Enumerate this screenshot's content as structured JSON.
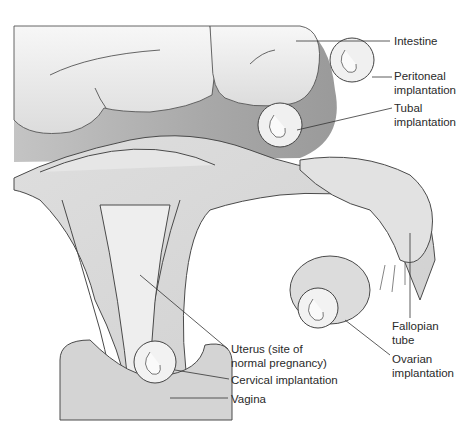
{
  "figure": {
    "colors": {
      "background": "#ffffff",
      "intestine_fill": "#ececec",
      "peritoneum_fill": "#a9a9a9",
      "tissue_fill": "#d8d8d8",
      "outline": "#4a4a4a",
      "leader_line": "#333333",
      "text": "#2a2a2a"
    }
  },
  "labels": {
    "intestine": "Intestine",
    "peritoneal_1": "Peritoneal",
    "peritoneal_2": "implantation",
    "tubal_1": "Tubal",
    "tubal_2": "implantation",
    "fallopian_1": "Fallopian",
    "fallopian_2": "tube",
    "ovarian_1": "Ovarian",
    "ovarian_2": "implantation",
    "uterus_1": "Uterus (site of",
    "uterus_2": "normal pregnancy)",
    "cervical": "Cervical implantation",
    "vagina": "Vagina"
  }
}
